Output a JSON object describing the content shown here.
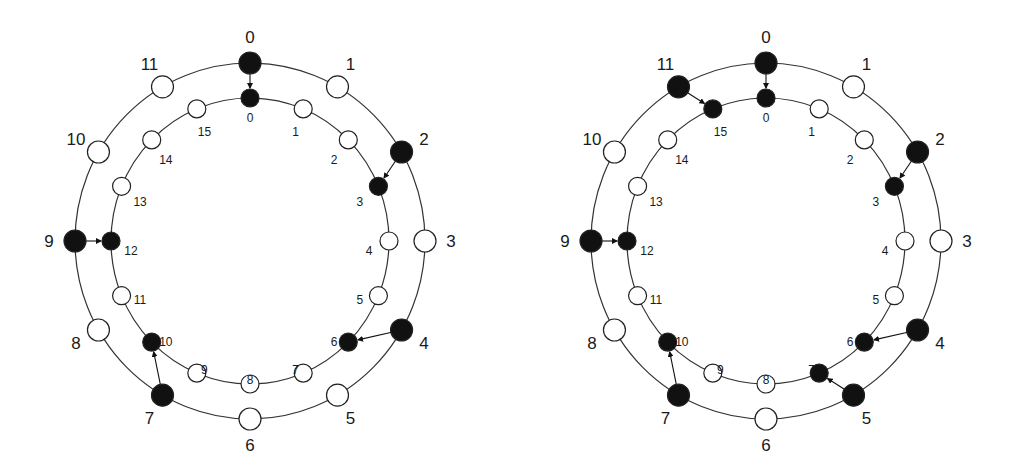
{
  "diagrams": [
    {
      "id": "left",
      "center": [
        250,
        241
      ],
      "outer_ring": {
        "nodes": 12,
        "rx": 175,
        "ry": 178,
        "filled": [
          0,
          2,
          4,
          7,
          9
        ]
      },
      "inner_ring": {
        "nodes": 16,
        "rx": 139,
        "ry": 143,
        "filled": [
          0,
          3,
          6,
          10,
          12
        ]
      },
      "mappings": [
        [
          0,
          0
        ],
        [
          2,
          3
        ],
        [
          4,
          6
        ],
        [
          7,
          10
        ],
        [
          9,
          12
        ]
      ]
    },
    {
      "id": "right",
      "center": [
        766,
        241
      ],
      "outer_ring": {
        "nodes": 12,
        "rx": 175,
        "ry": 178,
        "filled": [
          0,
          2,
          4,
          5,
          7,
          9,
          11
        ]
      },
      "inner_ring": {
        "nodes": 16,
        "rx": 139,
        "ry": 143,
        "filled": [
          0,
          3,
          6,
          7,
          10,
          12,
          15
        ]
      },
      "mappings": [
        [
          0,
          0
        ],
        [
          2,
          3
        ],
        [
          4,
          6
        ],
        [
          5,
          7
        ],
        [
          7,
          10
        ],
        [
          9,
          12
        ],
        [
          11,
          15
        ]
      ]
    }
  ],
  "colors": {
    "line": "#333333",
    "filled": "#111111",
    "empty": "#ffffff"
  }
}
